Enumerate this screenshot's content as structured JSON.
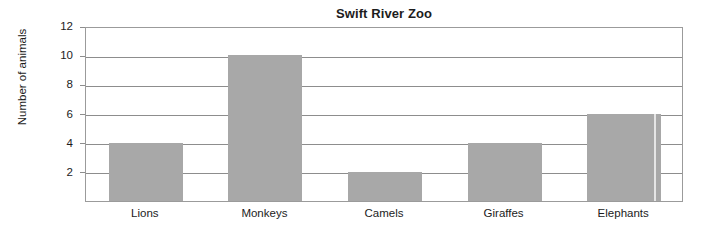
{
  "chart_data": {
    "type": "bar",
    "title": "Swift River Zoo",
    "xlabel": "",
    "ylabel": "Number of animals",
    "categories": [
      "Lions",
      "Monkeys",
      "Camels",
      "Giraffes",
      "Elephants"
    ],
    "values": [
      4,
      10,
      2,
      4,
      6
    ],
    "series": [
      {
        "name": "Number of animals",
        "values": [
          4,
          10,
          2,
          4,
          6
        ]
      }
    ],
    "ylim": [
      0,
      12
    ],
    "ytick_labels": [
      "2",
      "4",
      "6",
      "8",
      "10",
      "12"
    ],
    "ytick_values": [
      2,
      4,
      6,
      8,
      10,
      12
    ],
    "grid": true,
    "grid_axis": "y",
    "legend": false,
    "legend_position": "none",
    "bar_color": "#a8a8a8",
    "axis_color": "#8d8d8d",
    "background_color": "#ffffff",
    "text_color": "#1c1c1c"
  }
}
